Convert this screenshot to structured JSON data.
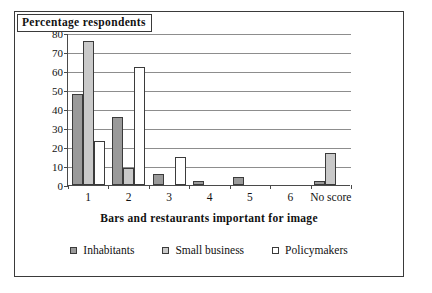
{
  "chart_data": {
    "type": "bar",
    "title": "Percentage respondents",
    "xlabel": "Bars and restaurants important for image",
    "ylabel": "",
    "ylim": [
      0,
      80
    ],
    "ytick_step": 10,
    "yticks": [
      0,
      10,
      20,
      30,
      40,
      50,
      60,
      70,
      80
    ],
    "grid": true,
    "legend_position": "bottom",
    "categories": [
      "1",
      "2",
      "3",
      "4",
      "5",
      "6",
      "No score"
    ],
    "series": [
      {
        "name": "Inhabitants",
        "color": "#9a9a9a",
        "values": [
          48,
          36,
          6,
          2,
          4,
          0,
          2
        ]
      },
      {
        "name": "Small business",
        "color": "#c9c9c9",
        "values": [
          76,
          9,
          0,
          0,
          0,
          0,
          17
        ]
      },
      {
        "name": "Policymakers",
        "color": "#ffffff",
        "values": [
          23,
          62,
          15,
          0,
          0,
          0,
          0
        ]
      }
    ]
  },
  "legend": {
    "items": [
      {
        "label": "Inhabitants"
      },
      {
        "label": "Small business"
      },
      {
        "label": "Policymakers"
      }
    ]
  }
}
